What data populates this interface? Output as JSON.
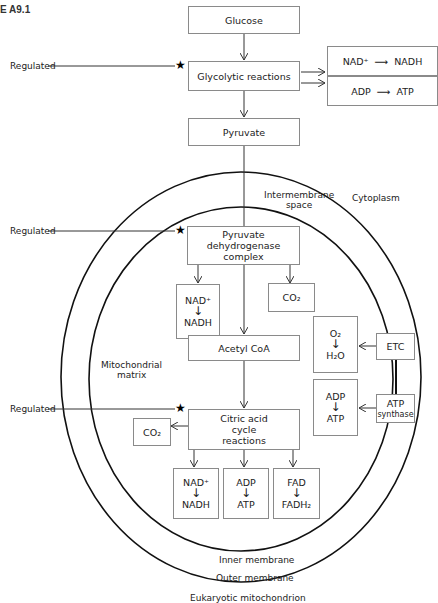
{
  "figure_label": "E A9.1",
  "caption": "Eukaryotic mitochondrion",
  "regulated_label": "Regulated",
  "regions": {
    "cytoplasm": "Cytoplasm",
    "intermembrane_space_1": "Intermembrane",
    "intermembrane_space_2": "space",
    "matrix_1": "Mitochondrial",
    "matrix_2": "matrix",
    "inner_membrane": "Inner membrane",
    "outer_membrane": "Outer membrane"
  },
  "boxes": {
    "glucose": "Glucose",
    "glycolysis": "Glycolytic reactions",
    "glyco_nad": {
      "from": "NAD⁺",
      "to": "NADH"
    },
    "glyco_adp": {
      "from": "ADP",
      "to": "ATP"
    },
    "pyruvate": "Pyruvate",
    "pdh_1": "Pyruvate",
    "pdh_2": "dehydrogenase",
    "pdh_3": "complex",
    "pdh_nad": {
      "from": "NAD⁺",
      "to": "NADH"
    },
    "pdh_co2": "CO₂",
    "acetyl_coa": "Acetyl CoA",
    "citric_1": "Citric acid",
    "citric_2": "cycle",
    "citric_3": "reactions",
    "citric_co2": "CO₂",
    "citric_nad": {
      "from": "NAD⁺",
      "to": "NADH"
    },
    "citric_adp": {
      "from": "ADP",
      "to": "ATP"
    },
    "citric_fad": {
      "from": "FAD",
      "to": "FADH₂"
    },
    "etc": "ETC",
    "etc_o2": {
      "from": "O₂",
      "to": "H₂O"
    },
    "atp_synthase_1": "ATP",
    "atp_synthase_2": "synthase",
    "atps_adp": {
      "from": "ADP",
      "to": "ATP"
    }
  },
  "symbols": {
    "down_arrow": "↓",
    "right_arrow": "⟶",
    "star": "★"
  }
}
